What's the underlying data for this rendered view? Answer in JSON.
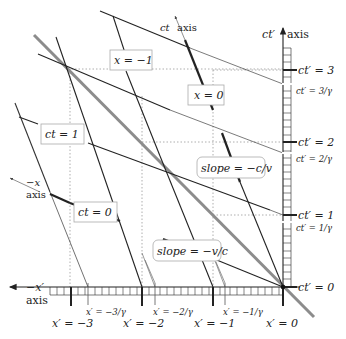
{
  "diagram": {
    "colors": {
      "background": "#ffffff",
      "line_dark": "#222222",
      "light_line": "#8c8c8c",
      "grid_dotted": "#999999",
      "label_box_border": "#aaaaaa"
    },
    "axes": {
      "ct_prime_axis": {
        "symbol": "ct′",
        "word": "axis"
      },
      "neg_x_prime_axis": {
        "symbol": "−x′",
        "word": "axis"
      },
      "ct_axis": {
        "symbol": "ct",
        "word": "axis"
      },
      "neg_x_axis": {
        "symbol": "−x",
        "word": "axis"
      }
    },
    "ct_prime_ticks": [
      {
        "label": "ct′ = 3"
      },
      {
        "label": "ct′ = 2"
      },
      {
        "label": "ct′ = 1"
      },
      {
        "label": "ct′ = 0"
      }
    ],
    "ct_prime_gamma_ticks": [
      {
        "label": "ct′ = 3/γ"
      },
      {
        "label": "ct′ = 2/γ"
      },
      {
        "label": "ct′ = 1/γ"
      }
    ],
    "x_prime_ticks": [
      {
        "label": "x′ = −3"
      },
      {
        "label": "x′ = −2"
      },
      {
        "label": "x′ = −1"
      },
      {
        "label": "x′ = 0"
      }
    ],
    "x_prime_gamma_ticks": [
      {
        "label": "x′ = −3/γ"
      },
      {
        "label": "x′ = −2/γ"
      },
      {
        "label": "x′ = −1/γ"
      }
    ],
    "boxed_labels": {
      "x_neg1": "x = −1",
      "x_0": "x = 0",
      "ct_1": "ct = 1",
      "ct_0": "ct = 0",
      "slope_c_v": "slope = −c/v",
      "slope_v_c": "slope = −v/c"
    }
  }
}
